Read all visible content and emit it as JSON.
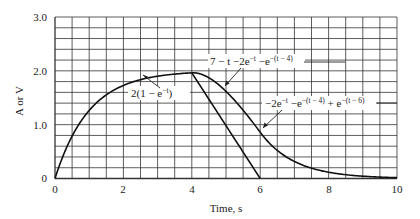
{
  "chart_data": {
    "type": "line",
    "title": "",
    "xlabel": "Time, s",
    "ylabel": "A or V",
    "xlim": [
      0,
      10
    ],
    "ylim": [
      0,
      3.0
    ],
    "x_ticks": [
      0,
      2,
      4,
      6,
      8,
      10
    ],
    "x_tick_labels": [
      "0",
      "2",
      "4",
      "6",
      "8",
      "10"
    ],
    "y_ticks": [
      0,
      1.0,
      2.0,
      3.0
    ],
    "y_tick_labels": [
      "0",
      "1.0",
      "2.0",
      "3.0"
    ],
    "grid": true,
    "grid_x_step": 0.5,
    "grid_y_step": 0.2,
    "legend": null,
    "series": [
      {
        "name": "2(1 − e^−t)",
        "domain": [
          0,
          4
        ],
        "x": [
          0,
          0.5,
          1,
          1.5,
          2,
          2.5,
          3,
          3.5,
          4
        ],
        "values": [
          0,
          0.787,
          1.264,
          1.554,
          1.729,
          1.836,
          1.9,
          1.94,
          1.963
        ]
      },
      {
        "name": "7 − t − 2e^−t − e^−(t − 4)",
        "domain": [
          4,
          6
        ],
        "x": [
          4,
          4.5,
          5,
          5.5,
          6
        ],
        "values": [
          1.963,
          1.871,
          1.619,
          1.268,
          0.86
        ]
      },
      {
        "name": "−2e^−t − e^−(t − 4) + e^−(t − 6)",
        "domain": [
          6,
          10
        ],
        "x": [
          6,
          7,
          8,
          9,
          10
        ],
        "values": [
          0.86,
          0.316,
          0.116,
          0.043,
          0.016
        ]
      },
      {
        "name": "linear decay",
        "domain": [
          4,
          6
        ],
        "x": [
          4,
          6
        ],
        "values": [
          1.963,
          0
        ]
      }
    ],
    "annotations": [
      {
        "text": "2(1 − e",
        "sup": "−t",
        "tail": ")",
        "points_to": [
          2.6,
          1.85
        ]
      },
      {
        "text": "7 − t −2e",
        "sup": "−t",
        "mid": " −e",
        "sup2": "−(t − 4)",
        "points_to": [
          4.9,
          1.67
        ]
      },
      {
        "text": "−2e",
        "sup": "−t",
        "mid": " −e",
        "sup2": "−(t − 4)",
        "mid2": " + e",
        "sup3": "−(t − 6)",
        "points_to": [
          6.1,
          0.78
        ]
      }
    ]
  },
  "labels": {
    "xlabel": "Time, s",
    "ylabel": "A or V",
    "y0": "0",
    "y1": "1.0",
    "y2": "2.0",
    "y3": "3.0",
    "x0": "0",
    "x2": "2",
    "x4": "4",
    "x6": "6",
    "x8": "8",
    "x10": "10",
    "ann1_a": "2(1 − e",
    "ann1_sup": "−t",
    "ann1_b": ")",
    "ann2_a": "7 − t −2e",
    "ann2_sup": "−t",
    "ann2_b": " −e",
    "ann2_sup2": "−(t − 4)",
    "ann3_a": "−2e",
    "ann3_sup": "−t",
    "ann3_b": " −e",
    "ann3_sup2": "−(t − 4)",
    "ann3_c": " + e",
    "ann3_sup3": "−(t − 6)"
  }
}
